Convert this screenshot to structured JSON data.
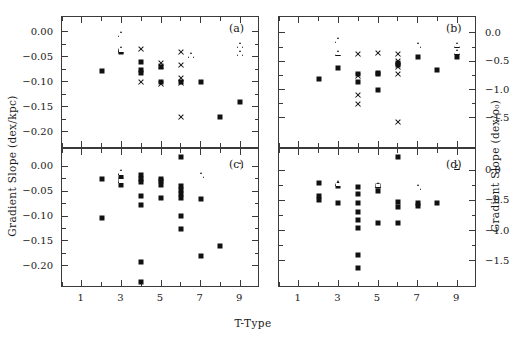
{
  "figure": {
    "xlabel": "T-Type",
    "ylabel_left": "Gradient Slope (dex/kpc)",
    "ylabel_right": "Gradient Slope (dex/ρ₀)",
    "background": "#ffffff",
    "ink": "#111111"
  },
  "chart_data": [
    {
      "type": "scatter",
      "panel": "a",
      "label": "(a)",
      "title": "",
      "xlabel": "T-Type",
      "ylabel": "Gradient Slope (dex/kpc)",
      "xlim": [
        0,
        10
      ],
      "ylim": [
        -0.235,
        0.03
      ],
      "xticks": [
        1,
        3,
        5,
        7,
        9
      ],
      "xtick_minor": [
        0,
        2,
        4,
        6,
        8,
        10
      ],
      "yticks": [
        0.0,
        -0.05,
        -0.1,
        -0.15,
        -0.2
      ],
      "ytick_labels": [
        "0.00",
        "-0.05",
        "-0.10",
        "-0.15",
        "-0.20"
      ],
      "grid": false,
      "legend": "none",
      "series": [
        {
          "name": "filled-square",
          "marker": "square",
          "points": [
            [
              2.0,
              -0.079
            ],
            [
              3.0,
              -0.04
            ],
            [
              3.0,
              -0.038
            ],
            [
              4.0,
              -0.06
            ],
            [
              4.0,
              -0.077
            ],
            [
              4.0,
              -0.083
            ],
            [
              5.0,
              -0.07
            ],
            [
              5.0,
              -0.1
            ],
            [
              6.0,
              -0.1
            ],
            [
              7.0,
              -0.1
            ],
            [
              8.0,
              -0.17
            ],
            [
              9.0,
              -0.14
            ],
            [
              4.1,
              -0.258
            ]
          ]
        },
        {
          "name": "open-triangle",
          "marker": "triangle",
          "points": [
            [
              3.0,
              -0.004
            ],
            [
              3.0,
              -0.035
            ],
            [
              6.5,
              -0.047
            ],
            [
              9.0,
              -0.027
            ],
            [
              9.0,
              -0.042
            ]
          ]
        },
        {
          "name": "cross",
          "marker": "cross",
          "points": [
            [
              4.0,
              -0.035
            ],
            [
              4.0,
              -0.1
            ],
            [
              5.0,
              -0.063
            ],
            [
              5.0,
              -0.068
            ],
            [
              5.0,
              -0.105
            ],
            [
              6.0,
              -0.04
            ],
            [
              6.0,
              -0.067
            ],
            [
              6.0,
              -0.093
            ],
            [
              6.0,
              -0.103
            ],
            [
              6.0,
              -0.17
            ]
          ]
        }
      ]
    },
    {
      "type": "scatter",
      "panel": "b",
      "label": "(b)",
      "title": "",
      "xlabel": "T-Type",
      "ylabel": "Gradient Slope (dex/ρ₀)",
      "xlim": [
        0,
        10
      ],
      "ylim": [
        -2.05,
        0.28
      ],
      "xticks": [
        1,
        3,
        5,
        7,
        9
      ],
      "xtick_minor": [
        0,
        2,
        4,
        6,
        8,
        10
      ],
      "yticks": [
        0.0,
        -0.5,
        -1.0,
        -1.5
      ],
      "ytick_labels": [
        "0.0",
        "-0.5",
        "-1.0",
        "-1.5"
      ],
      "grid": false,
      "legend": "none",
      "series": [
        {
          "name": "filled-square",
          "marker": "square",
          "points": [
            [
              2.0,
              -0.82
            ],
            [
              3.0,
              -0.62
            ],
            [
              4.0,
              -0.73
            ],
            [
              4.0,
              -0.86
            ],
            [
              5.0,
              -0.7
            ],
            [
              5.0,
              -0.72
            ],
            [
              5.0,
              -1.0
            ],
            [
              6.0,
              -0.53
            ],
            [
              6.0,
              -0.57
            ],
            [
              7.0,
              -0.43
            ],
            [
              8.0,
              -0.66
            ],
            [
              9.0,
              -0.42
            ]
          ]
        },
        {
          "name": "open-triangle",
          "marker": "triangle",
          "points": [
            [
              3.0,
              -0.13
            ],
            [
              3.0,
              -0.35
            ],
            [
              7.0,
              -0.22
            ],
            [
              9.0,
              -0.21
            ],
            [
              9.0,
              -0.33
            ]
          ]
        },
        {
          "name": "cross",
          "marker": "cross",
          "points": [
            [
              4.0,
              -0.37
            ],
            [
              4.0,
              -0.76
            ],
            [
              4.0,
              -1.1
            ],
            [
              4.0,
              -1.25
            ],
            [
              5.0,
              -0.36
            ],
            [
              6.0,
              -0.38
            ],
            [
              6.0,
              -0.5
            ],
            [
              6.0,
              -0.6
            ],
            [
              6.0,
              -0.72
            ],
            [
              6.0,
              -1.57
            ]
          ]
        }
      ]
    },
    {
      "type": "scatter",
      "panel": "c",
      "label": "(c)",
      "title": "",
      "xlabel": "T-Type",
      "ylabel": "Gradient Slope (dex/kpc)",
      "xlim": [
        0,
        10
      ],
      "ylim": [
        -0.245,
        0.035
      ],
      "xticks": [
        1,
        3,
        5,
        7,
        9
      ],
      "xtick_minor": [
        0,
        2,
        4,
        6,
        8,
        10
      ],
      "yticks": [
        0.0,
        -0.05,
        -0.1,
        -0.15,
        -0.2
      ],
      "ytick_labels": [
        "0.00",
        "-0.05",
        "-0.10",
        "-0.15",
        "-0.20"
      ],
      "grid": false,
      "legend": "none",
      "series": [
        {
          "name": "filled-square",
          "marker": "square",
          "points": [
            [
              2.0,
              -0.025
            ],
            [
              2.0,
              -0.104
            ],
            [
              3.0,
              -0.02
            ],
            [
              3.0,
              -0.027
            ],
            [
              3.0,
              -0.038
            ],
            [
              4.0,
              -0.017
            ],
            [
              4.0,
              -0.025
            ],
            [
              4.0,
              -0.032
            ],
            [
              4.0,
              -0.06
            ],
            [
              4.0,
              -0.078
            ],
            [
              4.0,
              -0.193
            ],
            [
              4.0,
              -0.232
            ],
            [
              5.0,
              -0.025
            ],
            [
              5.0,
              -0.03
            ],
            [
              5.0,
              -0.037
            ],
            [
              5.0,
              -0.064
            ],
            [
              6.0,
              0.019
            ],
            [
              6.0,
              -0.04
            ],
            [
              6.0,
              -0.048
            ],
            [
              6.0,
              -0.056
            ],
            [
              6.0,
              -0.064
            ],
            [
              6.0,
              -0.099
            ],
            [
              6.0,
              -0.127
            ],
            [
              7.0,
              -0.066
            ],
            [
              7.0,
              -0.18
            ],
            [
              8.0,
              -0.16
            ]
          ]
        },
        {
          "name": "open-triangle",
          "marker": "triangle",
          "points": [
            [
              3.0,
              -0.012
            ],
            [
              3.0,
              -0.028
            ],
            [
              7.0,
              -0.018
            ],
            [
              9.0,
              0.002
            ]
          ]
        }
      ]
    },
    {
      "type": "scatter",
      "panel": "d",
      "label": "(d)",
      "title": "",
      "xlabel": "T-Type",
      "ylabel": "Gradient Slope (dex/ρ₀)",
      "xlim": [
        0,
        10
      ],
      "ylim": [
        -1.95,
        0.35
      ],
      "xticks": [
        1,
        3,
        5,
        7,
        9
      ],
      "xtick_minor": [
        0,
        2,
        4,
        6,
        8,
        10
      ],
      "yticks": [
        0.0,
        -0.5,
        -1.0,
        -1.5
      ],
      "ytick_labels": [
        "0.0",
        "-0.5",
        "-1.0",
        "-1.5"
      ],
      "grid": false,
      "legend": "none",
      "series": [
        {
          "name": "filled-square",
          "marker": "square",
          "points": [
            [
              2.0,
              -0.21
            ],
            [
              2.0,
              -0.42
            ],
            [
              2.0,
              -0.5
            ],
            [
              3.0,
              -0.26
            ],
            [
              3.0,
              -0.55
            ],
            [
              4.0,
              -0.28
            ],
            [
              4.0,
              -0.4
            ],
            [
              4.0,
              -0.55
            ],
            [
              4.0,
              -0.7
            ],
            [
              4.0,
              -0.82
            ],
            [
              4.0,
              -0.95
            ],
            [
              4.0,
              -1.4
            ],
            [
              4.0,
              -1.62
            ],
            [
              5.0,
              -0.27
            ],
            [
              5.0,
              -0.35
            ],
            [
              5.0,
              -0.87
            ],
            [
              6.0,
              0.22
            ],
            [
              6.0,
              -0.53
            ],
            [
              6.0,
              -0.61
            ],
            [
              6.0,
              -0.88
            ],
            [
              7.0,
              -0.55
            ],
            [
              7.0,
              -0.6
            ],
            [
              8.0,
              -0.55
            ]
          ]
        },
        {
          "name": "open-triangle",
          "marker": "triangle",
          "points": [
            [
              3.0,
              -0.22
            ],
            [
              5.0,
              -0.24
            ],
            [
              7.0,
              -0.28
            ],
            [
              9.0,
              0.06
            ]
          ]
        }
      ]
    }
  ]
}
